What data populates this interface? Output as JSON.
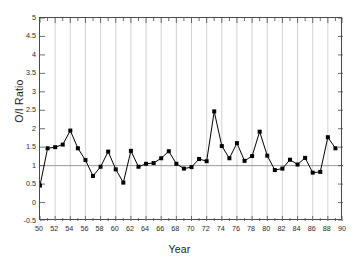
{
  "chart_data": {
    "type": "line",
    "title": "",
    "xlabel": "Year",
    "ylabel": "O/I Ratio",
    "xlim": [
      50,
      90
    ],
    "ylim": [
      -0.5,
      5.0
    ],
    "grid": "vertical gridlines at even years; horizontal reference line at y=1",
    "legend": "none",
    "marker": "filled square",
    "line_color": "#000000",
    "marker_color": "#000000",
    "grid_color": "#c8c8c8",
    "reference_line": {
      "y": 1.0,
      "color": "#808080"
    },
    "y_ticks": [
      -0.5,
      0,
      0.5,
      1,
      1.5,
      2,
      2.5,
      3,
      3.5,
      4,
      4.5,
      5
    ],
    "y_tick_labels": [
      "-0.5",
      "0",
      "0.5",
      "1",
      "1.5",
      "2",
      "2.5",
      "3",
      "3.5",
      "4",
      "4.5",
      "5"
    ],
    "x_ticks": [
      50,
      52,
      54,
      56,
      58,
      60,
      62,
      64,
      66,
      68,
      70,
      72,
      74,
      76,
      78,
      80,
      82,
      84,
      86,
      88,
      90
    ],
    "x_tick_labels": [
      "50",
      "52",
      "54",
      "56",
      "58",
      "60",
      "62",
      "64",
      "66",
      "68",
      "70",
      "72",
      "74",
      "76",
      "78",
      "80",
      "82",
      "84",
      "86",
      "88",
      "90"
    ],
    "x_minor_tick_step": 1,
    "x": [
      50,
      51,
      52,
      53,
      54,
      55,
      56,
      57,
      58,
      59,
      60,
      61,
      62,
      63,
      64,
      65,
      66,
      67,
      68,
      69,
      70,
      71,
      72,
      73,
      74,
      75,
      76,
      77,
      78,
      79,
      80,
      81,
      82,
      83,
      84,
      85,
      86,
      87,
      88,
      89
    ],
    "values": [
      0.46,
      1.47,
      1.5,
      1.57,
      1.95,
      1.47,
      1.15,
      0.72,
      0.97,
      1.38,
      0.9,
      0.54,
      1.4,
      0.97,
      1.05,
      1.07,
      1.2,
      1.39,
      1.05,
      0.92,
      0.96,
      1.18,
      1.12,
      2.47,
      1.53,
      1.2,
      1.61,
      1.13,
      1.26,
      1.92,
      1.27,
      0.88,
      0.92,
      1.16,
      1.03,
      1.21,
      0.81,
      0.83,
      1.77,
      1.47
    ],
    "series": [
      {
        "name": "O/I Ratio",
        "points": [
          {
            "year": 50,
            "value": 0.46
          },
          {
            "year": 51,
            "value": 1.47
          },
          {
            "year": 52,
            "value": 1.5
          },
          {
            "year": 53,
            "value": 1.57
          },
          {
            "year": 54,
            "value": 1.95
          },
          {
            "year": 55,
            "value": 1.47
          },
          {
            "year": 56,
            "value": 1.15
          },
          {
            "year": 57,
            "value": 0.72
          },
          {
            "year": 58,
            "value": 0.97
          },
          {
            "year": 59,
            "value": 1.38
          },
          {
            "year": 60,
            "value": 0.9
          },
          {
            "year": 61,
            "value": 0.54
          },
          {
            "year": 62,
            "value": 1.4
          },
          {
            "year": 63,
            "value": 0.97
          },
          {
            "year": 64,
            "value": 1.05
          },
          {
            "year": 65,
            "value": 1.07
          },
          {
            "year": 66,
            "value": 1.2
          },
          {
            "year": 67,
            "value": 1.39
          },
          {
            "year": 68,
            "value": 1.05
          },
          {
            "year": 69,
            "value": 0.92
          },
          {
            "year": 70,
            "value": 0.96
          },
          {
            "year": 71,
            "value": 1.18
          },
          {
            "year": 72,
            "value": 1.12
          },
          {
            "year": 73,
            "value": 2.47
          },
          {
            "year": 74,
            "value": 1.53
          },
          {
            "year": 75,
            "value": 1.2
          },
          {
            "year": 76,
            "value": 1.61
          },
          {
            "year": 77,
            "value": 1.13
          },
          {
            "year": 78,
            "value": 1.26
          },
          {
            "year": 79,
            "value": 1.92
          },
          {
            "year": 80,
            "value": 1.27
          },
          {
            "year": 81,
            "value": 0.88
          },
          {
            "year": 82,
            "value": 0.92
          },
          {
            "year": 83,
            "value": 1.16
          },
          {
            "year": 84,
            "value": 1.03
          },
          {
            "year": 85,
            "value": 1.21
          },
          {
            "year": 86,
            "value": 0.81
          },
          {
            "year": 87,
            "value": 0.83
          },
          {
            "year": 88,
            "value": 1.77
          },
          {
            "year": 89,
            "value": 1.47
          }
        ]
      }
    ]
  }
}
